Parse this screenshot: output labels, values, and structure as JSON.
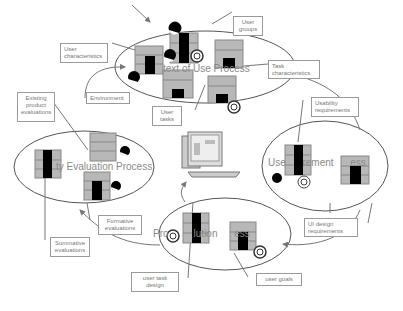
{
  "processes": {
    "context_of_use": {
      "title": "text of Use Process"
    },
    "requirements": {
      "title": "Use      rement      ess"
    },
    "evaluation": {
      "title": "ty Evaluation Process"
    },
    "production": {
      "title": "Pro         lution      ess"
    }
  },
  "labels": {
    "user_groups": "User groups",
    "user_characteristics": "User characteristics",
    "task_characteristics": "Task characteristics",
    "environment": "Environment",
    "user_tasks": "User tasks",
    "existing_product_evaluations": "Existing product evaluations",
    "usability_requirements": "Usability requirements",
    "ui_design_requirements": "UI design requirements",
    "formative_evaluations": "Formative evaluations",
    "summative_evaluations": "Summative evaluations",
    "user_task_design": "user task design",
    "user_goals": "user goals"
  },
  "colors": {
    "grid": "#b8b8b8",
    "block": "#000000",
    "line": "#666666"
  }
}
